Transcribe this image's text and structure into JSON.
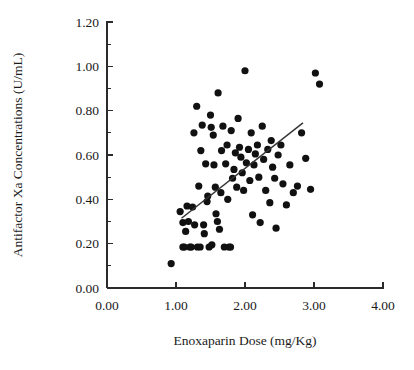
{
  "chart_data": {
    "type": "scatter",
    "title": "",
    "xlabel": "Enoxaparin Dose (mg/Kg)",
    "ylabel": "Antifactor Xa Concentrations (U/mL)",
    "xlim": [
      0.0,
      4.0
    ],
    "ylim": [
      0.0,
      1.2
    ],
    "xticks": [
      "0.00",
      "1.00",
      "2.00",
      "3.00",
      "4.00"
    ],
    "xtick_values": [
      0.0,
      1.0,
      2.0,
      3.0,
      4.0
    ],
    "yticks": [
      "0.00",
      "0.20",
      "0.40",
      "0.60",
      "0.80",
      "1.00",
      "1.20"
    ],
    "ytick_values": [
      0.0,
      0.2,
      0.4,
      0.6,
      0.8,
      1.0,
      1.2
    ],
    "x_minor_step": 0.5,
    "y_minor_step": 0.1,
    "grid": false,
    "legend": "none",
    "marker": "filled-circle",
    "marker_color": "#111111",
    "marker_size_px": 4.6,
    "trendline": {
      "present": true,
      "color": "#333333",
      "x_start": 1.08,
      "y_start": 0.315,
      "x_end": 2.84,
      "y_end": 0.745
    },
    "points": [
      [
        0.93,
        0.11
      ],
      [
        1.06,
        0.345
      ],
      [
        1.1,
        0.295
      ],
      [
        1.1,
        0.185
      ],
      [
        1.12,
        0.185
      ],
      [
        1.14,
        0.255
      ],
      [
        1.16,
        0.37
      ],
      [
        1.18,
        0.3
      ],
      [
        1.2,
        0.185
      ],
      [
        1.22,
        0.185
      ],
      [
        1.24,
        0.365
      ],
      [
        1.26,
        0.7
      ],
      [
        1.27,
        0.285
      ],
      [
        1.3,
        0.82
      ],
      [
        1.31,
        0.185
      ],
      [
        1.33,
        0.46
      ],
      [
        1.35,
        0.185
      ],
      [
        1.36,
        0.62
      ],
      [
        1.38,
        0.735
      ],
      [
        1.4,
        0.285
      ],
      [
        1.41,
        0.245
      ],
      [
        1.43,
        0.56
      ],
      [
        1.45,
        0.39
      ],
      [
        1.46,
        0.415
      ],
      [
        1.48,
        0.185
      ],
      [
        1.5,
        0.78
      ],
      [
        1.51,
        0.725
      ],
      [
        1.52,
        0.195
      ],
      [
        1.54,
        0.69
      ],
      [
        1.55,
        0.555
      ],
      [
        1.57,
        0.455
      ],
      [
        1.58,
        0.335
      ],
      [
        1.6,
        0.3
      ],
      [
        1.61,
        0.88
      ],
      [
        1.63,
        0.265
      ],
      [
        1.65,
        0.43
      ],
      [
        1.66,
        0.62
      ],
      [
        1.68,
        0.73
      ],
      [
        1.7,
        0.185
      ],
      [
        1.72,
        0.56
      ],
      [
        1.74,
        0.645
      ],
      [
        1.75,
        0.4
      ],
      [
        1.77,
        0.185
      ],
      [
        1.79,
        0.185
      ],
      [
        1.8,
        0.71
      ],
      [
        1.82,
        0.495
      ],
      [
        1.84,
        0.535
      ],
      [
        1.86,
        0.61
      ],
      [
        1.88,
        0.455
      ],
      [
        1.9,
        0.765
      ],
      [
        1.92,
        0.635
      ],
      [
        1.94,
        0.59
      ],
      [
        1.96,
        0.52
      ],
      [
        1.98,
        0.44
      ],
      [
        2.0,
        0.98
      ],
      [
        2.02,
        0.565
      ],
      [
        2.05,
        0.625
      ],
      [
        2.07,
        0.485
      ],
      [
        2.09,
        0.7
      ],
      [
        2.11,
        0.33
      ],
      [
        2.13,
        0.555
      ],
      [
        2.15,
        0.605
      ],
      [
        2.18,
        0.645
      ],
      [
        2.2,
        0.5
      ],
      [
        2.22,
        0.295
      ],
      [
        2.25,
        0.73
      ],
      [
        2.27,
        0.58
      ],
      [
        2.3,
        0.44
      ],
      [
        2.33,
        0.625
      ],
      [
        2.36,
        0.385
      ],
      [
        2.38,
        0.665
      ],
      [
        2.4,
        0.545
      ],
      [
        2.43,
        0.495
      ],
      [
        2.45,
        0.27
      ],
      [
        2.48,
        0.6
      ],
      [
        2.52,
        0.645
      ],
      [
        2.55,
        0.47
      ],
      [
        2.6,
        0.375
      ],
      [
        2.65,
        0.555
      ],
      [
        2.7,
        0.43
      ],
      [
        2.76,
        0.46
      ],
      [
        2.82,
        0.7
      ],
      [
        2.88,
        0.585
      ],
      [
        2.95,
        0.445
      ],
      [
        3.02,
        0.97
      ],
      [
        3.08,
        0.92
      ]
    ],
    "n_points": 85
  },
  "annotations": {
    "axis_color": "#2b2b2b"
  }
}
